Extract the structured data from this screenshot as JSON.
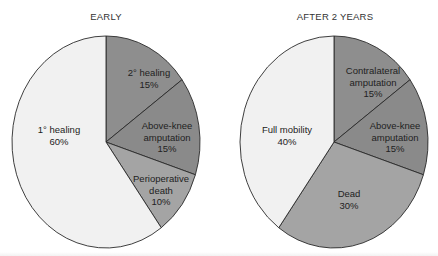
{
  "chart_data": [
    {
      "type": "pie",
      "title": "EARLY",
      "slices": [
        {
          "label": "2° healing",
          "value": 15,
          "display": "15%",
          "color": "#8e8e8e"
        },
        {
          "label": "Above-knee amputation",
          "value": 15,
          "display": "15%",
          "color": "#8a8a8a"
        },
        {
          "label": "Perioperative death",
          "value": 10,
          "display": "10%",
          "color": "#a4a4a4"
        },
        {
          "label": "1° healing",
          "value": 60,
          "display": "60%",
          "color": "#f1f1f1"
        }
      ],
      "start_angle": "12 o'clock, clockwise",
      "legend": "none (labels inside slices)"
    },
    {
      "type": "pie",
      "title": "AFTER 2 YEARS",
      "slices": [
        {
          "label": "Contralateral amputation",
          "value": 15,
          "display": "15%",
          "color": "#8e8e8e"
        },
        {
          "label": "Above-knee amputation",
          "value": 15,
          "display": "15%",
          "color": "#8a8a8a"
        },
        {
          "label": "Dead",
          "value": 30,
          "display": "30%",
          "color": "#a4a4a4"
        },
        {
          "label": "Full mobility",
          "value": 40,
          "display": "40%",
          "color": "#f1f1f1"
        }
      ],
      "start_angle": "12 o'clock, clockwise",
      "legend": "none (labels inside slices)"
    }
  ],
  "charts": {
    "left": {
      "title": "EARLY",
      "labels": {
        "s0": {
          "line1": "2° healing",
          "line2": "15%"
        },
        "s1": {
          "line1": "Above-knee",
          "line2": "amputation",
          "line3": "15%"
        },
        "s2": {
          "line1": "Perioperative",
          "line2": "death",
          "line3": "10%"
        },
        "s3": {
          "line1": "1° healing",
          "line2": "60%"
        }
      }
    },
    "right": {
      "title": "AFTER 2 YEARS",
      "labels": {
        "s0": {
          "line1": "Contralateral",
          "line2": "amputation",
          "line3": "15%"
        },
        "s1": {
          "line1": "Above-knee",
          "line2": "amputation",
          "line3": "15%"
        },
        "s2": {
          "line1": "Dead",
          "line2": "30%"
        },
        "s3": {
          "line1": "Full mobility",
          "line2": "40%"
        }
      }
    }
  }
}
